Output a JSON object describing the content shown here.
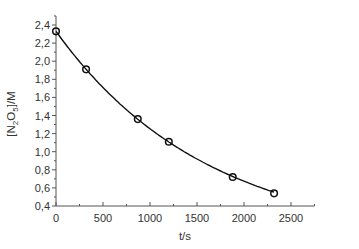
{
  "chart_data": {
    "type": "scatter",
    "title": "",
    "xlabel": "t/s",
    "ylabel": "[N2O5]/M",
    "ylabel_parts": {
      "open": "[N",
      "sub1": "2",
      "mid": "O",
      "sub2": "5",
      "close": "]/M"
    },
    "xlim": [
      0,
      2750
    ],
    "ylim": [
      0.4,
      2.5
    ],
    "x_ticks": [
      0,
      500,
      1000,
      1500,
      2000,
      2500
    ],
    "x_tick_labels": [
      "0",
      "500",
      "1000",
      "1500",
      "2000",
      "2500"
    ],
    "y_ticks": [
      0.4,
      0.6,
      0.8,
      1.0,
      1.2,
      1.4,
      1.6,
      1.8,
      2.0,
      2.2,
      2.4
    ],
    "y_tick_labels": [
      "0,4",
      "0,6",
      "0,8",
      "1,0",
      "1,2",
      "1,4",
      "1,6",
      "1,8",
      "2,0",
      "2,2",
      "2,4"
    ],
    "grid": false,
    "legend": null,
    "series": [
      {
        "name": "measured",
        "marker": "open-circle",
        "x": [
          0,
          320,
          870,
          1200,
          1880,
          2320
        ],
        "y": [
          2.33,
          1.91,
          1.36,
          1.11,
          0.72,
          0.54
        ]
      },
      {
        "name": "fit",
        "style": "line",
        "model": "exponential decay",
        "c0": 2.33,
        "k": 0.00062
      }
    ],
    "colors": {
      "axis": "#555555",
      "line": "#111111",
      "marker": "#111111",
      "text": "#333333"
    }
  }
}
